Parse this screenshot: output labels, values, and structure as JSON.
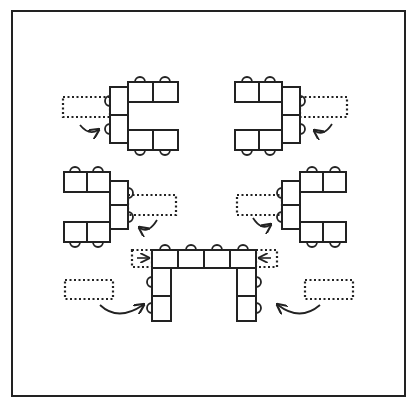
{
  "diagram": {
    "type": "table-arrangement",
    "colors": {
      "ink": "#222222",
      "background": "#ffffff"
    },
    "frame": {
      "x": 12,
      "y": 11,
      "w": 393,
      "h": 385
    },
    "groups": [
      {
        "id": "top-left-c",
        "tables": [
          [
            110,
            87,
            18,
            28
          ],
          [
            110,
            115,
            18,
            28
          ],
          [
            128,
            82,
            25,
            20
          ],
          [
            153,
            82,
            25,
            20
          ],
          [
            128,
            130,
            25,
            20
          ],
          [
            153,
            130,
            25,
            20
          ]
        ],
        "chairs_top": [
          [
            140,
            82
          ],
          [
            165,
            82
          ]
        ],
        "chairs_bottom": [
          [
            140,
            150
          ],
          [
            165,
            150
          ]
        ],
        "chairs_left": [
          [
            110,
            101
          ],
          [
            110,
            129
          ]
        ],
        "chairs_right": [],
        "dotted": [
          63,
          97,
          47,
          20
        ],
        "arrow": {
          "from": [
            80,
            125
          ],
          "to": [
            98,
            130
          ],
          "dir": "curve"
        }
      },
      {
        "id": "top-right-c",
        "tables": [
          [
            282,
            87,
            18,
            28
          ],
          [
            282,
            115,
            18,
            28
          ],
          [
            235,
            82,
            24,
            20
          ],
          [
            259,
            82,
            23,
            20
          ],
          [
            235,
            130,
            24,
            20
          ],
          [
            259,
            130,
            23,
            20
          ]
        ],
        "chairs_top": [
          [
            247,
            82
          ],
          [
            270,
            82
          ]
        ],
        "chairs_bottom": [
          [
            247,
            150
          ],
          [
            270,
            150
          ]
        ],
        "chairs_left": [],
        "chairs_right": [
          [
            300,
            101
          ],
          [
            300,
            129
          ]
        ],
        "dotted": [
          300,
          97,
          47,
          20
        ],
        "arrow": {
          "from": [
            332,
            124
          ],
          "to": [
            315,
            131
          ],
          "dir": "curve"
        }
      },
      {
        "id": "mid-left-c",
        "tables": [
          [
            110,
            181,
            18,
            24
          ],
          [
            110,
            205,
            18,
            24
          ],
          [
            64,
            172,
            23,
            20
          ],
          [
            87,
            172,
            23,
            20
          ],
          [
            64,
            222,
            23,
            20
          ],
          [
            87,
            222,
            23,
            20
          ]
        ],
        "chairs_top": [
          [
            75,
            172
          ],
          [
            98,
            172
          ]
        ],
        "chairs_bottom": [
          [
            75,
            242
          ],
          [
            98,
            242
          ]
        ],
        "chairs_left": [],
        "chairs_right": [
          [
            128,
            193
          ],
          [
            128,
            217
          ]
        ],
        "dotted": [
          128,
          195,
          48,
          20
        ],
        "arrow": {
          "from": [
            157,
            220
          ],
          "to": [
            140,
            228
          ],
          "dir": "curve"
        }
      },
      {
        "id": "mid-right-c",
        "tables": [
          [
            282,
            181,
            18,
            24
          ],
          [
            282,
            205,
            18,
            24
          ],
          [
            300,
            172,
            23,
            20
          ],
          [
            323,
            172,
            23,
            20
          ],
          [
            300,
            222,
            23,
            20
          ],
          [
            323,
            222,
            23,
            20
          ]
        ],
        "chairs_top": [
          [
            312,
            172
          ],
          [
            335,
            172
          ]
        ],
        "chairs_bottom": [
          [
            312,
            242
          ],
          [
            335,
            242
          ]
        ],
        "chairs_left": [
          [
            282,
            193
          ],
          [
            282,
            217
          ]
        ],
        "chairs_right": [],
        "dotted": [
          237,
          195,
          45,
          20
        ],
        "arrow": {
          "from": [
            253,
            218
          ],
          "to": [
            270,
            225
          ],
          "dir": "curve"
        }
      },
      {
        "id": "bottom-u",
        "tables": [
          [
            152,
            250,
            26,
            18
          ],
          [
            178,
            250,
            26,
            18
          ],
          [
            204,
            250,
            26,
            18
          ],
          [
            230,
            250,
            26,
            18
          ],
          [
            152,
            268,
            19,
            28
          ],
          [
            152,
            296,
            19,
            25
          ],
          [
            237,
            268,
            19,
            28
          ],
          [
            237,
            296,
            19,
            25
          ]
        ],
        "chairs_top": [
          [
            165,
            250
          ],
          [
            191,
            250
          ],
          [
            217,
            250
          ],
          [
            243,
            250
          ]
        ],
        "chairs_bottom": [],
        "chairs_left": [
          [
            152,
            282
          ],
          [
            152,
            308
          ]
        ],
        "chairs_right": [
          [
            256,
            282
          ],
          [
            256,
            308
          ]
        ],
        "dotted_side": [
          [
            132,
            250,
            20,
            17
          ],
          [
            256,
            250,
            21,
            17
          ]
        ],
        "small_arrows": [
          {
            "x1": 137,
            "x2": 148,
            "y": 258,
            "dir": "right"
          },
          {
            "x1": 271,
            "x2": 260,
            "y": 258,
            "dir": "left"
          }
        ],
        "dotted_far": [
          [
            65,
            280,
            48,
            19
          ],
          [
            305,
            280,
            48,
            19
          ]
        ],
        "curved_arrows": [
          {
            "from": [
              100,
              305
            ],
            "ctrl": [
              118,
              322
            ],
            "to": [
              143,
              305
            ]
          },
          {
            "from": [
              320,
              305
            ],
            "ctrl": [
              300,
              322
            ],
            "to": [
              278,
              305
            ]
          }
        ]
      }
    ]
  }
}
